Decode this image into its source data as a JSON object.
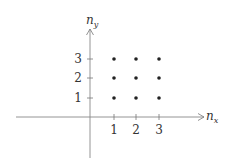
{
  "diagram": {
    "axes": {
      "x_label": "n",
      "x_label_sub": "x",
      "y_label": "n",
      "y_label_sub": "y"
    },
    "x_ticks": [
      "1",
      "2",
      "3"
    ],
    "y_ticks": [
      "1",
      "2",
      "3"
    ],
    "lattice_points": [
      [
        1,
        1
      ],
      [
        2,
        1
      ],
      [
        3,
        1
      ],
      [
        1,
        2
      ],
      [
        2,
        2
      ],
      [
        3,
        2
      ],
      [
        1,
        3
      ],
      [
        2,
        3
      ],
      [
        3,
        3
      ]
    ],
    "colors": {
      "axis": "#777777",
      "dot": "#222222",
      "text": "#333333"
    }
  }
}
